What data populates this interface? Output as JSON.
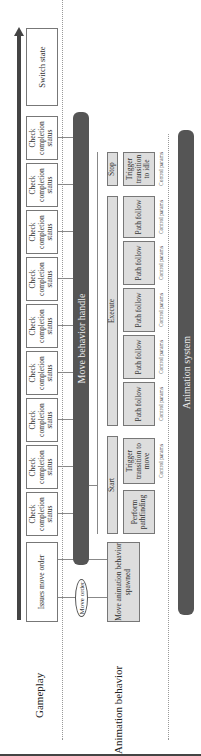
{
  "lanes": {
    "gameplay": "Gameplay",
    "animation_behavior": "Animation behavior"
  },
  "gameplay": {
    "issue_box": "Issues move order",
    "check_boxes": [
      "Check completion status",
      "Check completion status",
      "Check completion status",
      "Check completion status",
      "Check completion status",
      "Check completion status",
      "Check completion status",
      "Check completion status",
      "Check completion status"
    ],
    "switch_box": "Switch state"
  },
  "message": "Move order",
  "handle_bar": "Move behavior handle",
  "animation": {
    "spawned_box": "Move animation behavior spawned",
    "phases": {
      "start": "Start",
      "execute": "Execute",
      "stop": "Stop"
    },
    "start_steps": [
      "Perform pathfinding",
      "Trigger transition to move"
    ],
    "execute_steps": [
      "Path follow",
      "Path follow",
      "Path follow",
      "Path follow",
      "Path follow"
    ],
    "stop_steps": [
      "Trigger transition to idle"
    ],
    "control_params": [
      "Control params",
      "Control params",
      "Control params",
      "Control params",
      "Control params",
      "Control params",
      "Control params"
    ]
  },
  "system_bar": "Animation system",
  "colors": {
    "bar": "#555555",
    "step_fill": "#dddddd",
    "border": "#777777"
  }
}
